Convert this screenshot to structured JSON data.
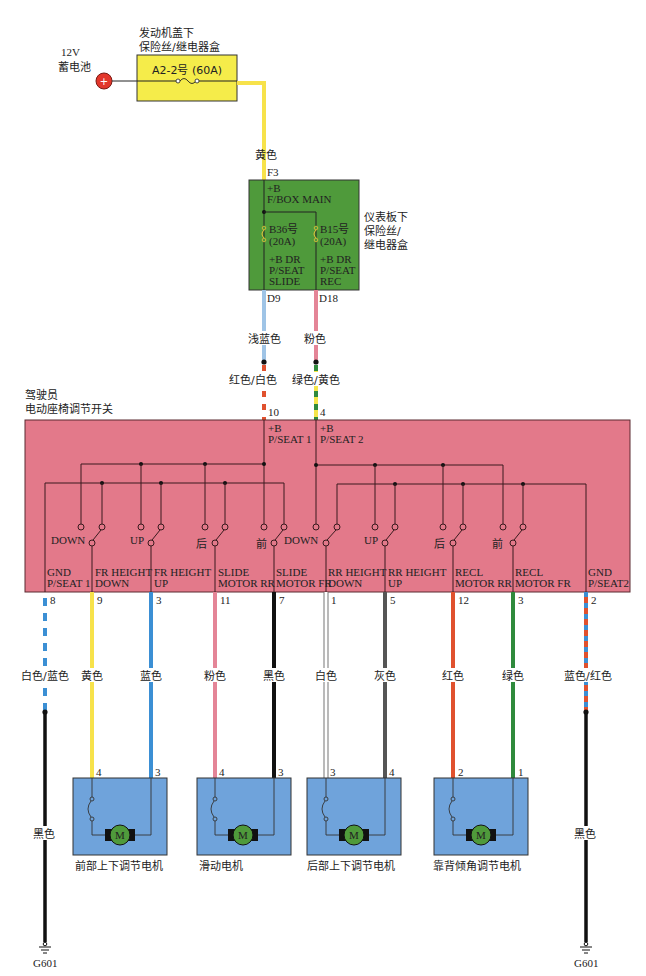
{
  "header_fragment": "",
  "battery": {
    "voltage": "12V",
    "name": "蓄电池",
    "symbol": "+"
  },
  "engine_fusebox": {
    "title_line1": "发动机盖下",
    "title_line2": "保险丝/继电器盒",
    "fuse_label": "A2-2号 (60A)",
    "color": "#f5ec4a"
  },
  "wire_to_panel": {
    "color_name": "黄色",
    "pin": "F3",
    "color": "#f7e24a"
  },
  "panel_fusebox": {
    "title_line1": "仪表板下",
    "title_line2": "保险丝/",
    "title_line3": "继电器盒",
    "color": "#4f9a3b",
    "main_label1": "+B",
    "main_label2": "F/BOX MAIN",
    "fuses": [
      {
        "id": "B36号",
        "rating": "(20A)",
        "out1": "+B DR",
        "out2": "P/SEAT",
        "out3": "SLIDE",
        "pin": "D9"
      },
      {
        "id": "B15号",
        "rating": "(20A)",
        "out1": "+B DR",
        "out2": "P/SEAT",
        "out3": "REC",
        "pin": "D18"
      }
    ]
  },
  "feed_wires": [
    {
      "upper_color_name": "浅蓝色",
      "upper_color": "#9fc4e6",
      "lower_color_name": "红色/白色",
      "lower_color": "#e0512e",
      "lower_stripe": "#ffffff",
      "pin": "10"
    },
    {
      "upper_color_name": "粉色",
      "upper_color": "#e48597",
      "lower_color_name": "绿色/黄色",
      "lower_color": "#2f8a3c",
      "lower_stripe": "#f4e64a",
      "pin": "4"
    }
  ],
  "seat_switch": {
    "title_line1": "驾驶员",
    "title_line2": "电动座椅调节开关",
    "color": "#e3798a",
    "supply_labels": [
      {
        "line1": "+B",
        "line2": "P/SEAT 1"
      },
      {
        "line1": "+B",
        "line2": "P/SEAT 2"
      }
    ],
    "switches": [
      {
        "label": "DOWN"
      },
      {
        "label": "UP"
      },
      {
        "label": "后"
      },
      {
        "label": "前"
      },
      {
        "label": "DOWN"
      },
      {
        "label": "UP"
      },
      {
        "label": "后"
      },
      {
        "label": "前"
      }
    ],
    "terminals": [
      {
        "line1": "GND",
        "line2": "P/SEAT 1"
      },
      {
        "line1": "FR HEIGHT",
        "line2": "DOWN"
      },
      {
        "line1": "FR HEIGHT",
        "line2": "UP"
      },
      {
        "line1": "SLIDE",
        "line2": "MOTOR RR"
      },
      {
        "line1": "SLIDE",
        "line2": "MOTOR FR"
      },
      {
        "line1": "RR HEIGHT",
        "line2": "DOWN"
      },
      {
        "line1": "RR HEIGHT",
        "line2": "UP"
      },
      {
        "line1": "RECL",
        "line2": "MOTOR RR"
      },
      {
        "line1": "RECL",
        "line2": "MOTOR FR"
      },
      {
        "line1": "GND",
        "line2": "P/SEAT2"
      }
    ]
  },
  "output_wires": [
    {
      "pin": "8",
      "color_name": "白色/蓝色",
      "color": "#3b8fd4",
      "style": "dashed-blue"
    },
    {
      "pin": "9",
      "color_name": "黄色",
      "color": "#f7e24a"
    },
    {
      "pin": "3",
      "color_name": "蓝色",
      "color": "#3b8fd4"
    },
    {
      "pin": "11",
      "color_name": "粉色",
      "color": "#e48597"
    },
    {
      "pin": "7",
      "color_name": "黑色",
      "color": "#111111"
    },
    {
      "pin": "1",
      "color_name": "白色",
      "color": "#ffffff"
    },
    {
      "pin": "5",
      "color_name": "灰色",
      "color": "#555555"
    },
    {
      "pin": "12",
      "color_name": "红色",
      "color": "#e0512e"
    },
    {
      "pin": "3",
      "color_name": "绿色",
      "color": "#2f8a3c"
    },
    {
      "pin": "2",
      "color_name": "蓝色/红色",
      "color": "#e0512e",
      "stripe": "#3b8fd4"
    }
  ],
  "motors": [
    {
      "name": "前部上下调节电机",
      "pin_left": "4",
      "pin_right": "3",
      "symbol": "M"
    },
    {
      "name": "滑动电机",
      "pin_left": "4",
      "pin_right": "3",
      "symbol": "M"
    },
    {
      "name": "后部上下调节电机",
      "pin_left": "3",
      "pin_right": "4",
      "symbol": "M"
    },
    {
      "name": "靠背倾角调节电机",
      "pin_left": "2",
      "pin_right": "1",
      "symbol": "M"
    }
  ],
  "motor_box_color": "#6fa3db",
  "motor_circle_color": "#4f9a3b",
  "grounds": [
    {
      "wire_color_name": "黑色",
      "label": "G601"
    },
    {
      "wire_color_name": "黑色",
      "label": "G601"
    }
  ]
}
